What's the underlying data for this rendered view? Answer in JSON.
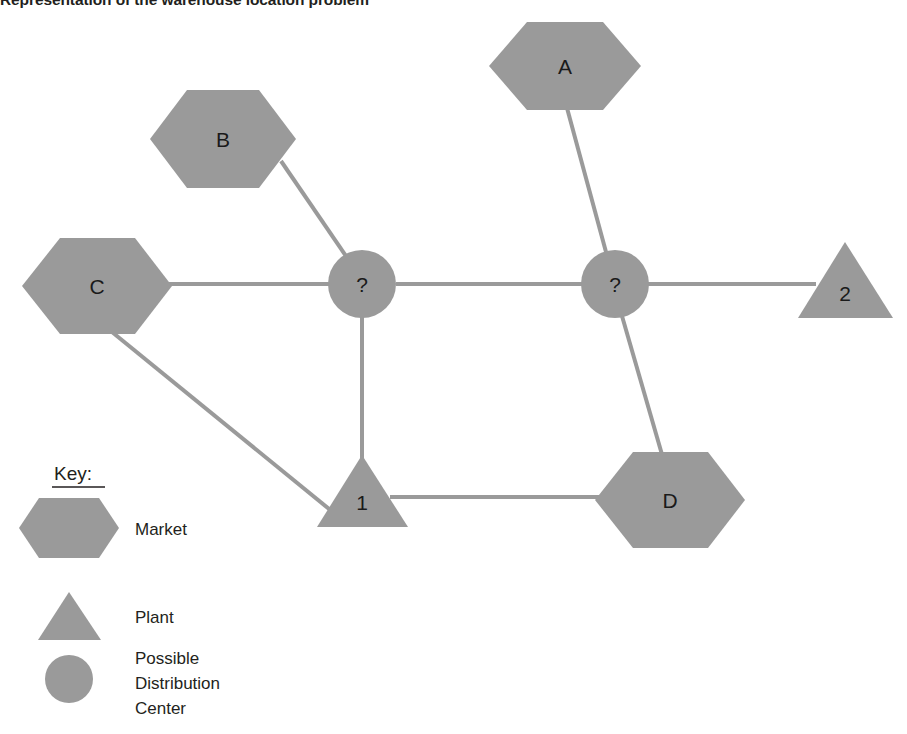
{
  "title": "Representation of the warehouse location problem",
  "colors": {
    "shape_fill": "#9a9a9a",
    "edge": "#9a9a9a",
    "text": "#231f20",
    "background": "#ffffff"
  },
  "diagram": {
    "markets": [
      {
        "id": "A",
        "label": "A",
        "shape": "hexagon"
      },
      {
        "id": "B",
        "label": "B",
        "shape": "hexagon"
      },
      {
        "id": "C",
        "label": "C",
        "shape": "hexagon"
      },
      {
        "id": "D",
        "label": "D",
        "shape": "hexagon"
      }
    ],
    "plants": [
      {
        "id": "1",
        "label": "1",
        "shape": "triangle"
      },
      {
        "id": "2",
        "label": "2",
        "shape": "triangle"
      }
    ],
    "distribution_centers": [
      {
        "id": "dc1",
        "label": "?",
        "shape": "circle"
      },
      {
        "id": "dc2",
        "label": "?",
        "shape": "circle"
      }
    ],
    "edges": [
      {
        "from": "B",
        "to": "dc1"
      },
      {
        "from": "C",
        "to": "dc1"
      },
      {
        "from": "C",
        "to": "1"
      },
      {
        "from": "dc1",
        "to": "1"
      },
      {
        "from": "dc1",
        "to": "dc2"
      },
      {
        "from": "A",
        "to": "dc2"
      },
      {
        "from": "dc2",
        "to": "2"
      },
      {
        "from": "dc2",
        "to": "D"
      },
      {
        "from": "1",
        "to": "D"
      }
    ]
  },
  "key": {
    "heading": "Key:",
    "entries": [
      {
        "shape": "hexagon",
        "label": "Market"
      },
      {
        "shape": "triangle",
        "label": "Plant"
      },
      {
        "shape": "circle",
        "label": "Possible\nDistribution\nCenter"
      }
    ],
    "dc_label_lines": [
      "Possible",
      "Distribution",
      "Center"
    ]
  }
}
